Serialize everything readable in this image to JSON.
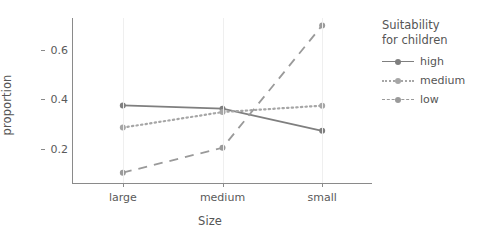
{
  "chart_data": {
    "type": "line",
    "title": "",
    "xlabel": "Size",
    "ylabel": "proportion",
    "categories": [
      "large",
      "medium",
      "small"
    ],
    "ytick_labels": [
      "0.2",
      "0.4",
      "0.6"
    ],
    "yticks": [
      0.2,
      0.4,
      0.6
    ],
    "ylim": [
      0.06,
      0.73
    ],
    "grid": "vertical-only",
    "legend_position": "right",
    "legend_title": "Suitability for children",
    "legend_title_lines": [
      "Suitability",
      "for children"
    ],
    "series": [
      {
        "name": "high",
        "line_style": "solid",
        "color": "#7f7f7f",
        "values": [
          0.375,
          0.362,
          0.272
        ]
      },
      {
        "name": "medium",
        "line_style": "dotted",
        "color": "#a6a6a6",
        "values": [
          0.285,
          0.348,
          0.374
        ]
      },
      {
        "name": "low",
        "line_style": "dashed",
        "color": "#9a9a9a",
        "values": [
          0.102,
          0.203,
          0.7
        ]
      }
    ]
  },
  "axes": {
    "x_title": "Size",
    "y_title": "proportion"
  },
  "colors": {
    "axis": "#8a8a8a",
    "text": "#555555",
    "grid": "#efefef",
    "series_high": "#7f7f7f",
    "series_medium": "#a6a6a6",
    "series_low": "#9a9a9a",
    "background": "#ffffff"
  }
}
